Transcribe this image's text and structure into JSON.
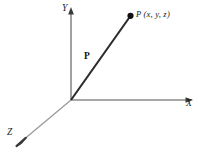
{
  "figure": {
    "type": "3d-coordinate-axes-vector-diagram",
    "background_color": "#ffffff",
    "axis_color": "#8a8a8a",
    "vector_color": "#2b2b2b",
    "label_color": "#1a1a1a",
    "axes": [
      {
        "id": "y-axis",
        "label": "Y",
        "direction": "up",
        "origin": [
          71,
          100
        ],
        "tip": [
          71,
          9
        ]
      },
      {
        "id": "x-axis",
        "label": "X",
        "direction": "right",
        "origin": [
          71,
          100
        ],
        "tip": [
          193,
          100
        ]
      },
      {
        "id": "z-axis",
        "label": "Z",
        "direction": "down-left",
        "origin": [
          71,
          100
        ],
        "tip": [
          17,
          146
        ]
      }
    ],
    "vector": {
      "id": "position-vector",
      "label": "P",
      "from": [
        71,
        100
      ],
      "to": [
        130,
        17
      ],
      "endpoint_marker": "filled-dot"
    },
    "point": {
      "id": "point-P",
      "label": "P (x, y, z)",
      "coordinates": [
        130,
        16
      ]
    }
  }
}
